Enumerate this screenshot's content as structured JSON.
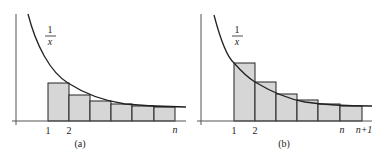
{
  "figure": {
    "panels": [
      {
        "id": "a",
        "caption": "(a)",
        "curve_label_num": "1",
        "curve_label_den": "x",
        "tick_labels": [
          "1",
          "2",
          "n"
        ],
        "description": "Rectangles under curve 1/x (lower Riemann sum)"
      },
      {
        "id": "b",
        "caption": "(b)",
        "curve_label_num": "1",
        "curve_label_den": "x",
        "tick_labels": [
          "1",
          "2",
          "n",
          "n+1"
        ],
        "description": "Rectangles above curve 1/x (upper Riemann sum)"
      }
    ],
    "colors": {
      "bar_fill": "#d6d6d6",
      "stroke": "#222222",
      "axis": "#555555"
    }
  }
}
